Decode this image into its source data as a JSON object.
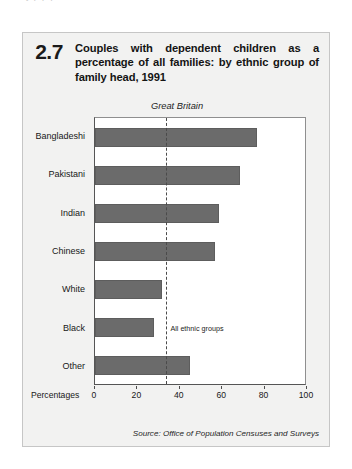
{
  "page": {
    "top_cut_text": "y                    p                     p              p"
  },
  "figure": {
    "number": "2.7",
    "title": "Couples with dependent children as a percentage of all families: by ethnic group of family head, 1991",
    "source": "Source: Office of Population Censuses and Surveys"
  },
  "colors": {
    "bar_fill": "#6b6b6b",
    "bar_stroke": "#5d5d5d",
    "panel_bg": "#f2f2f1",
    "panel_border": "#c6c6c6",
    "axis": "#555555",
    "ref_line": "#4a4a4a",
    "plot_bg": "#ffffff"
  },
  "chart_data": {
    "type": "bar",
    "orientation": "horizontal",
    "title": "Couples with dependent children as a percentage of all families: by ethnic group of family head, 1991",
    "subtitle": "Great Britain",
    "xlabel": "Percentages",
    "ylabel": "",
    "xlim": [
      0,
      100
    ],
    "xticks": [
      0,
      20,
      40,
      60,
      80,
      100
    ],
    "xtick_labels": [
      "0",
      "20",
      "40",
      "60",
      "80",
      "100"
    ],
    "grid": false,
    "legend": false,
    "categories": [
      "Bangladeshi",
      "Pakistani",
      "Indian",
      "Chinese",
      "White",
      "Black",
      "Other"
    ],
    "values": [
      77,
      69,
      59,
      57,
      32,
      28,
      45
    ],
    "annotations": [
      {
        "type": "reference-line",
        "label": "All ethnic groups",
        "value": 34,
        "style": "dashed",
        "orientation": "vertical"
      }
    ]
  }
}
